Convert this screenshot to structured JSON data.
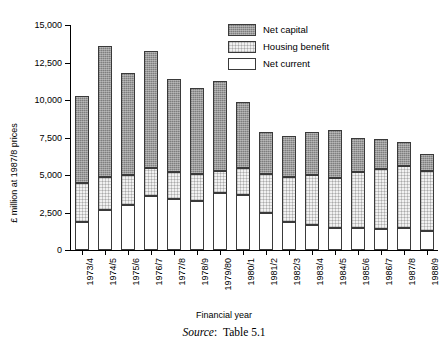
{
  "chart_data": {
    "type": "bar",
    "stacked": true,
    "title": "",
    "xlabel": "Financial year",
    "ylabel": "£ million at 1987/8 prices",
    "ylim": [
      0,
      15000
    ],
    "ytick_values": [
      0,
      2500,
      5000,
      7500,
      10000,
      12500,
      15000
    ],
    "ytick_labels": [
      "0",
      "2,500",
      "5,000",
      "7,500",
      "10,000",
      "12,500",
      "15,000"
    ],
    "grid": false,
    "legend_position": "top-right",
    "categories": [
      "1973/4",
      "1974/5",
      "1975/6",
      "1976/7",
      "1977/8",
      "1978/9",
      "1979/80",
      "1980/1",
      "1981/2",
      "1982/3",
      "1983/4",
      "1984/5",
      "1985/6",
      "1986/7",
      "1987/8",
      "1988/9"
    ],
    "series": [
      {
        "name": "Net current",
        "color": "#ffffff",
        "values": [
          1900,
          2700,
          3000,
          3600,
          3400,
          3300,
          3800,
          3700,
          2500,
          1900,
          1700,
          1500,
          1500,
          1400,
          1500,
          1300
        ]
      },
      {
        "name": "Housing benefit",
        "color": "#f1f1f1",
        "values": [
          2600,
          2200,
          2000,
          1900,
          1800,
          1800,
          1500,
          1800,
          2600,
          3000,
          3300,
          3300,
          3700,
          4000,
          4100,
          4000
        ]
      },
      {
        "name": "Net capital",
        "color": "#9a9a9a",
        "values": [
          5800,
          8700,
          6800,
          7800,
          6200,
          5700,
          6000,
          4400,
          2800,
          2700,
          2900,
          3200,
          2300,
          2000,
          1600,
          1100
        ]
      }
    ],
    "totals": [
      10300,
      13600,
      11800,
      13300,
      11400,
      10800,
      11300,
      9900,
      7900,
      7600,
      7900,
      8000,
      7500,
      7400,
      7200,
      6400
    ]
  },
  "legend": {
    "items": [
      {
        "label": "Net capital",
        "swatch": "dark-hatch-swatch"
      },
      {
        "label": "Housing benefit",
        "swatch": "light-dot-swatch"
      },
      {
        "label": "Net current",
        "swatch": "white-swatch"
      }
    ]
  },
  "caption": {
    "source_label": "Source",
    "source_separator": ":",
    "source_value": "Table 5.1"
  }
}
